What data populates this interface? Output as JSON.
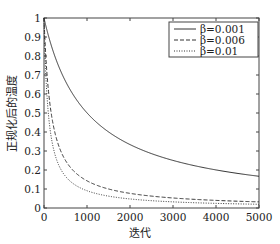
{
  "chart_data": {
    "type": "line",
    "title": "",
    "xlabel": "迭代",
    "ylabel": "正规化后的温度",
    "xlim": [
      0,
      5000
    ],
    "ylim": [
      0,
      1
    ],
    "grid": false,
    "legend_position": "upper right",
    "x_ticks": [
      0,
      1000,
      2000,
      3000,
      4000,
      5000
    ],
    "x_tick_labels": [
      "0",
      "1000",
      "2000",
      "3000",
      "4000",
      "5000"
    ],
    "y_ticks": [
      0,
      0.1,
      0.2,
      0.3,
      0.4,
      0.5,
      0.6,
      0.7,
      0.8,
      0.9,
      1
    ],
    "y_tick_labels": [
      "0",
      "0.1",
      "0.2",
      "0.3",
      "0.4",
      "0.5",
      "0.6",
      "0.7",
      "0.8",
      "0.9",
      "1"
    ],
    "x": [
      0,
      100,
      200,
      300,
      400,
      500,
      750,
      1000,
      1500,
      2000,
      2500,
      3000,
      3500,
      4000,
      4500,
      5000
    ],
    "series": [
      {
        "name": "β=0.001",
        "style": "solid",
        "values": [
          1.0,
          0.909,
          0.833,
          0.769,
          0.714,
          0.667,
          0.571,
          0.5,
          0.4,
          0.333,
          0.286,
          0.25,
          0.222,
          0.2,
          0.182,
          0.167
        ]
      },
      {
        "name": "β=0.006",
        "style": "dashed",
        "values": [
          1.0,
          0.625,
          0.455,
          0.357,
          0.294,
          0.25,
          0.182,
          0.143,
          0.1,
          0.077,
          0.0625,
          0.0526,
          0.0455,
          0.04,
          0.0357,
          0.0323
        ]
      },
      {
        "name": "β=0.01",
        "style": "dotted",
        "values": [
          1.0,
          0.5,
          0.333,
          0.25,
          0.2,
          0.167,
          0.118,
          0.0909,
          0.0625,
          0.0476,
          0.0385,
          0.0323,
          0.0278,
          0.0244,
          0.0217,
          0.0196
        ]
      }
    ]
  },
  "legend": {
    "items": [
      {
        "label": "β=0.001",
        "style": "solid"
      },
      {
        "label": "β=0.006",
        "style": "dashed"
      },
      {
        "label": "β=0.01",
        "style": "dotted"
      }
    ]
  },
  "colors": {
    "line": "#333333",
    "axis": "#444444",
    "background": "#ffffff"
  }
}
